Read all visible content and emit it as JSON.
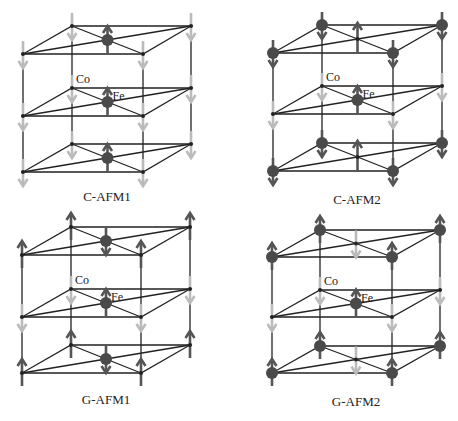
{
  "figure": {
    "colors": {
      "edge": "#222222",
      "dark_atom": "#4a4a4a",
      "dark_arrow": "#555555",
      "light_arrow": "#bbbbbb",
      "small_atom": "#222222"
    },
    "panels": [
      {
        "id": "c-afm1",
        "label": "C-AFM1",
        "label_pos": [
          107,
          197
        ],
        "corners": {
          "BL": [
            72,
            26
          ],
          "BR": [
            191,
            26
          ],
          "FL": [
            23,
            54
          ],
          "FR": [
            143,
            54
          ]
        },
        "layer_dy": [
          0,
          62,
          118
        ],
        "co_label": "Co",
        "fe_label": "Fe",
        "layers": [
          {
            "co": {
              "size": "small",
              "spin": "down",
              "arrow": "light"
            },
            "fe": {
              "size": "big",
              "spin": "up",
              "arrow": "dark"
            }
          },
          {
            "co": {
              "size": "small",
              "spin": "down",
              "arrow": "light"
            },
            "fe": {
              "size": "big",
              "spin": "up",
              "arrow": "dark"
            }
          },
          {
            "co": {
              "size": "small",
              "spin": "down",
              "arrow": "light"
            },
            "fe": {
              "size": "big",
              "spin": "up",
              "arrow": "dark"
            }
          }
        ]
      },
      {
        "id": "c-afm2",
        "label": "C-AFM2",
        "label_pos": [
          357,
          200
        ],
        "corners": {
          "BL": [
            322,
            25
          ],
          "BR": [
            442,
            25
          ],
          "FL": [
            273,
            53
          ],
          "FR": [
            393,
            53
          ]
        },
        "layer_dy": [
          0,
          61,
          118
        ],
        "co_label": "Co",
        "fe_label": "Fe",
        "layers": [
          {
            "co": {
              "size": "big",
              "spin": "down",
              "arrow": "dark"
            },
            "fe": {
              "size": "small",
              "spin": "up",
              "arrow": "dark"
            }
          },
          {
            "co": {
              "size": "small",
              "spin": "down",
              "arrow": "light"
            },
            "fe": {
              "size": "big",
              "spin": "up",
              "arrow": "dark"
            }
          },
          {
            "co": {
              "size": "big",
              "spin": "down",
              "arrow": "dark"
            },
            "fe": {
              "size": "small",
              "spin": "up",
              "arrow": "dark"
            }
          }
        ]
      },
      {
        "id": "g-afm1",
        "label": "G-AFM1",
        "label_pos": [
          106,
          400
        ],
        "corners": {
          "BL": [
            71,
            227
          ],
          "BR": [
            190,
            227
          ],
          "FL": [
            22,
            255
          ],
          "FR": [
            141,
            255
          ]
        },
        "layer_dy": [
          0,
          62,
          118
        ],
        "co_label": "Co",
        "fe_label": "Fe",
        "layers": [
          {
            "co": {
              "size": "small",
              "spin": "up",
              "arrow": "dark"
            },
            "fe": {
              "size": "big",
              "spin": "down",
              "arrow": "dark"
            }
          },
          {
            "co": {
              "size": "small",
              "spin": "down",
              "arrow": "light"
            },
            "fe": {
              "size": "big",
              "spin": "up",
              "arrow": "dark"
            }
          },
          {
            "co": {
              "size": "small",
              "spin": "up",
              "arrow": "dark"
            },
            "fe": {
              "size": "big",
              "spin": "down",
              "arrow": "dark"
            }
          }
        ]
      },
      {
        "id": "g-afm2",
        "label": "G-AFM2",
        "label_pos": [
          356,
          402
        ],
        "corners": {
          "BL": [
            320,
            230
          ],
          "BR": [
            440,
            230
          ],
          "FL": [
            272,
            257
          ],
          "FR": [
            392,
            257
          ]
        },
        "layer_dy": [
          0,
          60,
          116
        ],
        "co_label": "Co",
        "fe_label": "Fe",
        "layers": [
          {
            "co": {
              "size": "big",
              "spin": "up",
              "arrow": "dark"
            },
            "fe": {
              "size": "small",
              "spin": "down",
              "arrow": "light"
            }
          },
          {
            "co": {
              "size": "small",
              "spin": "down",
              "arrow": "light"
            },
            "fe": {
              "size": "big",
              "spin": "up",
              "arrow": "dark"
            }
          },
          {
            "co": {
              "size": "big",
              "spin": "up",
              "arrow": "dark"
            },
            "fe": {
              "size": "small",
              "spin": "down",
              "arrow": "light"
            }
          }
        ]
      }
    ]
  }
}
